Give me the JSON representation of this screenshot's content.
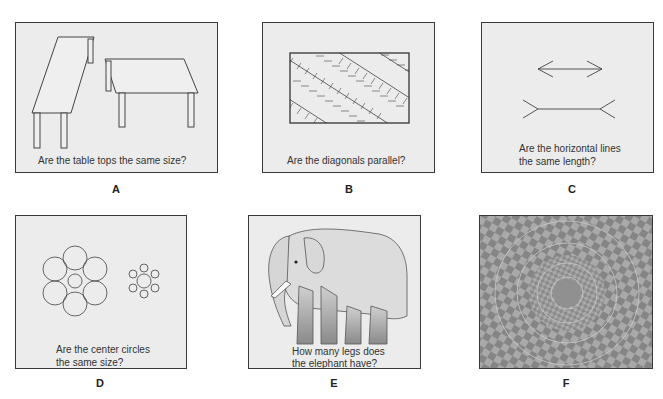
{
  "figure": {
    "panels": [
      {
        "id": "A",
        "label": "A",
        "caption": [
          "Are the table tops the same size?"
        ],
        "subject": "two-tables-illusion"
      },
      {
        "id": "B",
        "label": "B",
        "caption": [
          "Are the diagonals parallel?"
        ],
        "subject": "zollner-illusion"
      },
      {
        "id": "C",
        "label": "C",
        "caption": [
          "Are the horizontal lines",
          "the same length?"
        ],
        "subject": "muller-lyer-illusion"
      },
      {
        "id": "D",
        "label": "D",
        "caption": [
          "Are the center circles",
          "the same size?"
        ],
        "subject": "ebbinghaus-illusion"
      },
      {
        "id": "E",
        "label": "E",
        "caption": [
          "How many legs does",
          "the elephant have?"
        ],
        "subject": "elephant-legs-illusion"
      },
      {
        "id": "F",
        "label": "F",
        "caption": [],
        "subject": "fraser-spiral-illusion"
      }
    ],
    "colors": {
      "panel_bg": "#ececec",
      "border": "#3a3a3a",
      "line": "#444444",
      "text": "#333333",
      "spiral_dark": "#7a7a7a",
      "spiral_light": "#a8a8a8"
    }
  }
}
